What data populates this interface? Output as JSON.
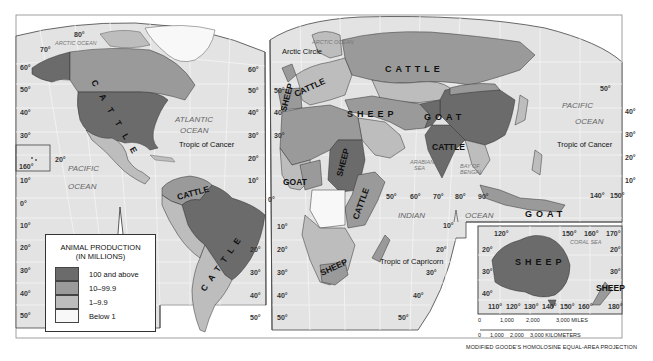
{
  "map": {
    "projection": "MODIFIED GOODE'S HOMOLOSINE EQUAL-AREA PROJECTION",
    "colors": {
      "ocean": "#e3e3e3",
      "grid": "#f4f4f4",
      "class_100_above": "#6b6b6b",
      "class_10_99": "#9a9a9a",
      "class_1_9": "#bdbdbd",
      "class_below_1": "#f8f8f8",
      "border": "#3a3a3a"
    },
    "oceans": {
      "arctic_left": "ARCTIC OCEAN",
      "arctic_right": "ARCTIC OCEAN",
      "atlantic_1": "ATLANTIC",
      "atlantic_2": "OCEAN",
      "pacific_left_1": "PACIFIC",
      "pacific_left_2": "OCEAN",
      "pacific_right_1": "PACIFIC",
      "pacific_right_2": "OCEAN",
      "indian_1": "INDIAN",
      "indian_2": "OCEAN",
      "arabian_1": "ARABIAN",
      "arabian_2": "SEA",
      "bengal_1": "BAY OF",
      "bengal_2": "BENGAL",
      "coral": "CORAL SEA"
    },
    "lines": {
      "arctic_circle": "Arctic Circle",
      "tropic_cancer_left": "Tropic of Cancer",
      "tropic_cancer_right": "Tropic of Cancer",
      "tropic_capricorn": "Tropic of Capricorn"
    },
    "animal_labels": {
      "north_america": "CATTLE",
      "russia": "CATTLE",
      "europe_sheep": "SHEEP",
      "europe_cattle": "CATTLE",
      "middle_east": "SHEEP",
      "central_asia": "GOAT",
      "india": "CATTLE",
      "sudan": "SHEEP",
      "east_africa": "CATTLE",
      "west_africa": "GOAT",
      "south_africa": "SHEEP",
      "colombia": "CATTLE",
      "brazil_argentina": "CATTLE",
      "indonesia": "GOAT",
      "australia": "SHEEP",
      "new_zealand": "SHEEP"
    },
    "degree_labels": {
      "left_lat": [
        "80°",
        "70°",
        "60°",
        "50°",
        "40°",
        "30°",
        "20°",
        "10°",
        "0°",
        "10°",
        "20°",
        "30°",
        "40°",
        "50°"
      ],
      "hawaii_lon": "160°",
      "hawaii_lat": "20°",
      "mid_lat_a": [
        "60°",
        "50°",
        "40°",
        "30°",
        "20°",
        "10°",
        "0°",
        "20°",
        "30°",
        "40°",
        "50°"
      ],
      "mid_lat_b": [
        "60°",
        "50°",
        "40°",
        "30°",
        "20°"
      ],
      "africa_lat": [
        "10°",
        "20°",
        "30°",
        "40°",
        "50°"
      ],
      "indian_lon": [
        "50°",
        "60°",
        "70°",
        "80°",
        "90°"
      ],
      "indian_lat": [
        "10°",
        "20°",
        "30°",
        "40°",
        "50°"
      ],
      "pacific_lat": [
        "50°",
        "40°",
        "30°",
        "20°",
        "10°"
      ],
      "pacific_lon": [
        "140°",
        "150°"
      ],
      "aus_top": [
        "120°",
        "150°",
        "160°",
        "170°"
      ],
      "aus_bottom": [
        "110°",
        "120°",
        "130°",
        "140°",
        "150°",
        "160°",
        "180°"
      ],
      "aus_left": [
        "20°",
        "30°",
        "40°"
      ],
      "aus_right": [
        "20°",
        "30°"
      ]
    }
  },
  "legend": {
    "title_line1": "ANIMAL PRODUCTION",
    "title_line2": "(IN MILLIONS)",
    "items": [
      {
        "label": "100 and above",
        "color": "#6b6b6b"
      },
      {
        "label": "10–99.9",
        "color": "#9a9a9a"
      },
      {
        "label": "1–9.9",
        "color": "#bdbdbd"
      },
      {
        "label": "Below 1",
        "color": "#f8f8f8"
      }
    ]
  },
  "scale_bar": {
    "miles": [
      "0",
      "1,000",
      "2,000",
      "3,000 MILES"
    ],
    "km": [
      "0",
      "1,000",
      "2,000",
      "3,000 KILOMETERS"
    ]
  }
}
